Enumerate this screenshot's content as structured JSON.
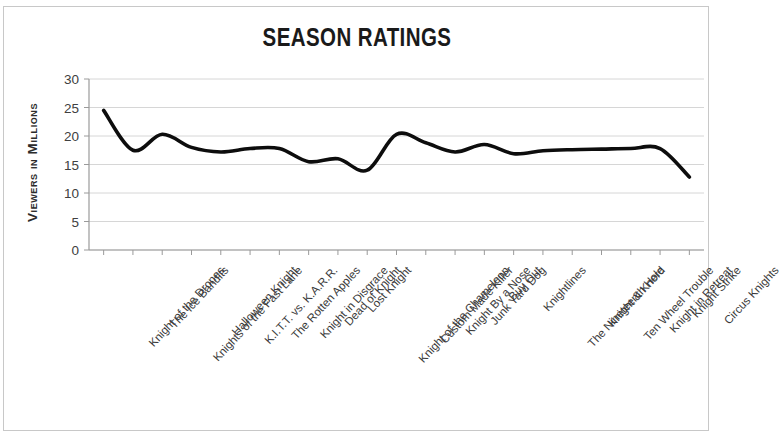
{
  "chart_data": {
    "type": "line",
    "title": "SEASON RATINGS",
    "xlabel": "",
    "ylabel": "Viewers in Millions",
    "ylim": [
      0,
      30
    ],
    "yticks": [
      0,
      5,
      10,
      15,
      20,
      25,
      30
    ],
    "grid": true,
    "legend": "none",
    "line_color": "#0d0d0d",
    "categories": [
      "Knight of the Drones",
      "The Ice Bandits",
      "Knights of the Fast Lane",
      "Halloween Knight",
      "K.I.T.T. vs. K.A.R.R.",
      "The Rotten Apples",
      "Knight in Disgrace",
      "Dead of Knight",
      "Lost Knight",
      "Knight of the Chameleon",
      "Custom Made Killer",
      "Knight By a Nose",
      "Junk Yard Dog",
      "Buy Out",
      "Knightlines",
      "The Nineteenth Hole",
      "Knight & Knerd",
      "Ten Wheel Trouble",
      "Knight in Retreat",
      "Knight Strike",
      "Circus Knights"
    ],
    "values": [
      24.5,
      17.5,
      20.3,
      18.0,
      17.2,
      17.8,
      17.8,
      15.5,
      16.0,
      14.0,
      20.3,
      18.8,
      17.2,
      18.5,
      16.9,
      17.4,
      17.6,
      17.7,
      17.8,
      17.8,
      12.8
    ]
  }
}
